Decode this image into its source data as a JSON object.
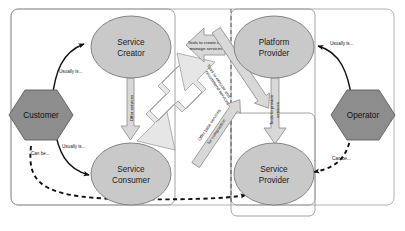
{
  "figure": {
    "caption": ""
  },
  "nodes": {
    "service_creator": "Service\nCreator",
    "service_creator_l1": "Service",
    "service_creator_l2": "Creator",
    "platform_provider_l1": "Platform",
    "platform_provider_l2": "Provider",
    "service_consumer_l1": "Service",
    "service_consumer_l2": "Consumer",
    "service_provider_l1": "Service",
    "service_provider_l2": "Provider"
  },
  "actors": {
    "customer": "Customer",
    "operator": "Operator"
  },
  "arrow_labels": {
    "tools_create_l1": "Tools to create and",
    "tools_create_l2": "manage services",
    "tools_execute_l1": "Tools to execute and",
    "tools_execute_l2": "recommend services",
    "offer_base_l1": "Offer base services",
    "offer_base_l2": "for composition",
    "tools_provide_l1": "Tools to provide",
    "tools_provide_l2": "services",
    "offer_services": "Offer services"
  },
  "relations": {
    "customer_creator": "Usually is...",
    "customer_consumer": "Usually is...",
    "customer_provider": "Can be...",
    "operator_platform": "Usually is...",
    "operator_provider": "Can be..."
  },
  "colors": {
    "node_fill": "#c9c9c9",
    "node_stroke": "#7a7a7a",
    "actor_fill": "#8d8d8d",
    "actor_stroke": "#5d5d5d",
    "arrow_fill": "#d2d2d2",
    "arrow_fill_light": "#e2e2e2",
    "arrow_stroke": "#8a8a8a",
    "group_stroke": "#9a9a9a",
    "outer_stroke": "#a8a8a8",
    "line": "#111111"
  }
}
